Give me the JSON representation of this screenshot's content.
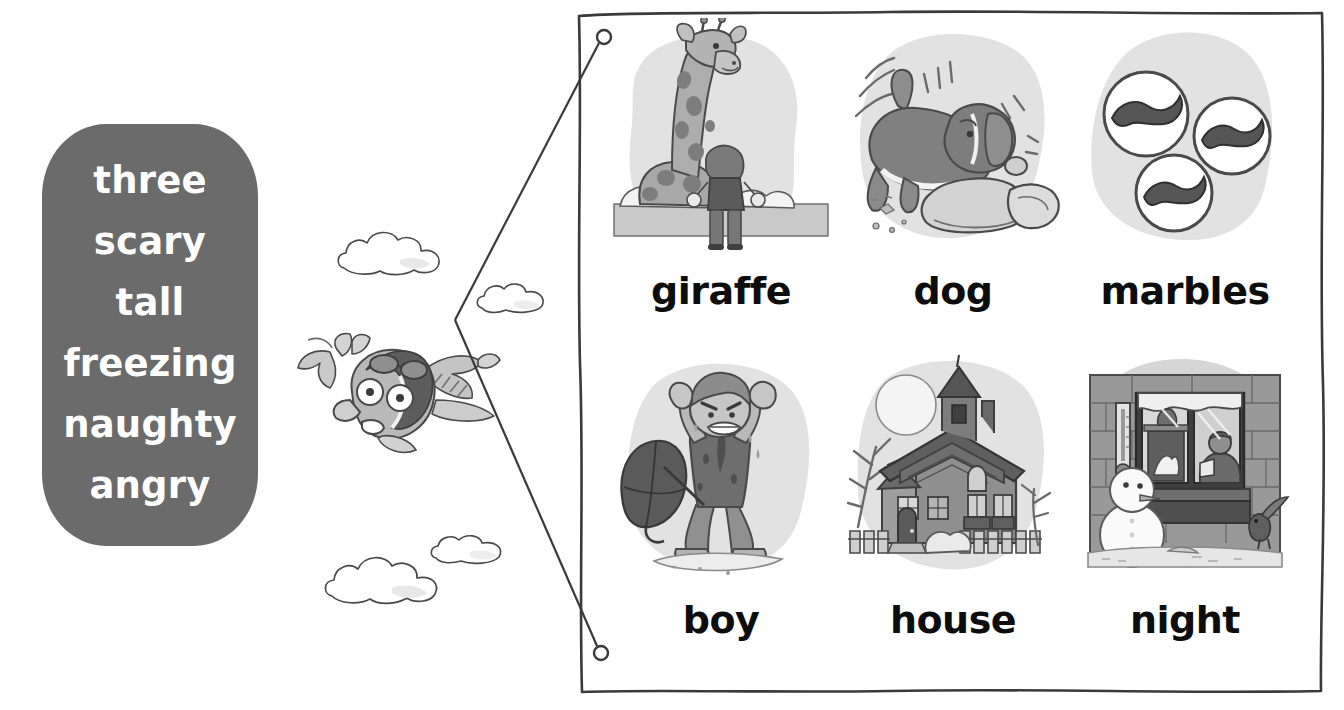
{
  "worksheet": {
    "type": "vocabulary-matching-exercise",
    "background_color": "#ffffff"
  },
  "word_bank": {
    "name": "adjective-word-bank",
    "background_color": "#6b6b6b",
    "text_color": "#ffffff",
    "words": [
      {
        "text": "three"
      },
      {
        "text": "scary"
      },
      {
        "text": "tall"
      },
      {
        "text": "freezing"
      },
      {
        "text": "naughty"
      },
      {
        "text": "angry"
      }
    ]
  },
  "answer_panel": {
    "name": "picture-answer-panel",
    "border_color": "#3a3a3a",
    "border_style": "hand-drawn",
    "pictures": [
      {
        "label": "giraffe",
        "illustration": "giraffe-with-child-icon"
      },
      {
        "label": "dog",
        "illustration": "dog-chewing-cushion-icon"
      },
      {
        "label": "marbles",
        "illustration": "three-marbles-icon"
      },
      {
        "label": "boy",
        "illustration": "angry-wet-boy-with-umbrella-icon"
      },
      {
        "label": "house",
        "illustration": "spooky-house-with-moon-icon"
      },
      {
        "label": "night",
        "illustration": "snowman-window-night-icon"
      }
    ]
  },
  "connector": {
    "name": "matching-connector-line",
    "color": "#3a3a3a",
    "endpoints": [
      {
        "name": "top-connector-dot",
        "x": 604,
        "y": 37
      },
      {
        "name": "bottom-connector-dot",
        "x": 601,
        "y": 653
      }
    ]
  },
  "decorations": {
    "bird": {
      "name": "flying-bird-aviator-icon"
    },
    "clouds": [
      {
        "name": "cloud-top-left"
      },
      {
        "name": "cloud-top-right"
      },
      {
        "name": "cloud-bottom-left"
      },
      {
        "name": "cloud-bottom-right"
      }
    ]
  }
}
